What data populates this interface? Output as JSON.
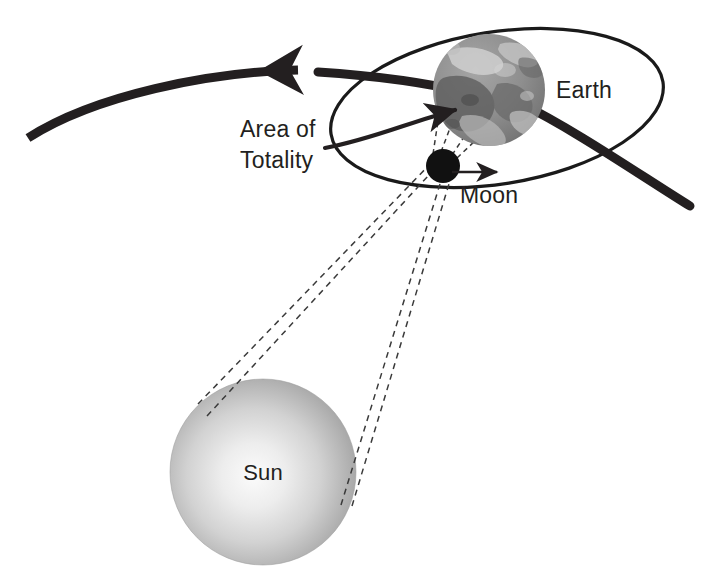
{
  "diagram": {
    "background_color": "#ffffff",
    "labels": {
      "earth": "Earth",
      "moon": "Moon",
      "sun": "Sun",
      "area_of_totality_line1": "Area of",
      "area_of_totality_line2": "Totality"
    },
    "colors": {
      "ink": "#231f20",
      "moon_fill": "#111111",
      "earth_base": "#8c8c8c",
      "earth_dark": "#5d5d5d",
      "earth_light": "#c9c9c9",
      "sun_center": "#f2f2f2",
      "sun_edge": "#9b9b9b",
      "dashed_line": "#3a3a3a"
    },
    "bodies": [
      {
        "name": "sun",
        "label": "Sun",
        "center_x": 263,
        "center_y": 472,
        "radius": 93,
        "style": "radial-gradient-sphere"
      },
      {
        "name": "earth",
        "label": "Earth",
        "center_x": 489,
        "center_y": 90,
        "radius": 56,
        "style": "textured-globe"
      },
      {
        "name": "moon",
        "label": "Moon",
        "center_x": 443,
        "center_y": 166,
        "radius": 17,
        "style": "solid-black-disc"
      }
    ],
    "paths": {
      "earth_orbit_arrow": {
        "name": "earth-orbital-path",
        "description": "thick curved line with arrowhead pointing left",
        "stroke_width": 9,
        "arrow_direction": "left"
      },
      "moon_orbit_ellipse": {
        "name": "moon-orbit-ellipse",
        "description": "thin tilted ellipse around Earth",
        "stroke_width": 3.2,
        "rotation_deg": -8
      },
      "moon_motion_arrow": {
        "name": "moon-direction-arrow",
        "description": "small arrow showing Moon travel direction",
        "arrow_direction": "right"
      },
      "totality_leader": {
        "name": "area-of-totality-leader",
        "description": "curved leader line from label to Earth surface with arrowhead"
      },
      "umbra_rays": {
        "name": "umbra-shadow-rays",
        "count": 4,
        "description": "dashed tangent lines from Sun limbs past the Moon",
        "dash_pattern": "6 5"
      },
      "totality_cone": {
        "name": "totality-cone-rays",
        "count": 2,
        "description": "dashed lines from Moon to Earth surface patch"
      }
    }
  }
}
